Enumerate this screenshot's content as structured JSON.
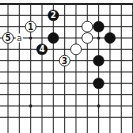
{
  "diagram": {
    "type": "go-board-fragment",
    "colors": {
      "background": "#ffffff",
      "line": "#222222",
      "black_stone": "#111111",
      "white_stone": "#ffffff"
    },
    "grid": {
      "origin_x": 8,
      "origin_y": 4,
      "spacing": 11.33,
      "columns": 12,
      "rows": 11,
      "top_edge": true
    },
    "star_points": [
      {
        "col": 2,
        "row": 3
      },
      {
        "col": 8,
        "row": 3
      },
      {
        "col": 2,
        "row": 9
      },
      {
        "col": 8,
        "row": 9
      }
    ],
    "stones": [
      {
        "col": 2,
        "row": 2,
        "color": "white",
        "label": "1"
      },
      {
        "col": 4,
        "row": 1,
        "color": "black",
        "label": "2"
      },
      {
        "col": 5,
        "row": 5,
        "color": "white",
        "label": "3"
      },
      {
        "col": 3,
        "row": 4,
        "color": "black",
        "label": "4"
      },
      {
        "col": 0,
        "row": 3,
        "color": "white",
        "label": "5"
      },
      {
        "col": 4,
        "row": 3,
        "color": "black",
        "label": ""
      },
      {
        "col": 7,
        "row": 2,
        "color": "white",
        "label": ""
      },
      {
        "col": 7,
        "row": 3,
        "color": "white",
        "label": ""
      },
      {
        "col": 6,
        "row": 4,
        "color": "white",
        "label": ""
      },
      {
        "col": 8,
        "row": 2,
        "color": "black",
        "label": ""
      },
      {
        "col": 9,
        "row": 3,
        "color": "black",
        "label": ""
      },
      {
        "col": 8,
        "row": 5,
        "color": "black",
        "label": ""
      },
      {
        "col": 8,
        "row": 7,
        "color": "black",
        "label": ""
      }
    ],
    "markers": [
      {
        "col": 1,
        "row": 3,
        "text": "a"
      }
    ]
  }
}
